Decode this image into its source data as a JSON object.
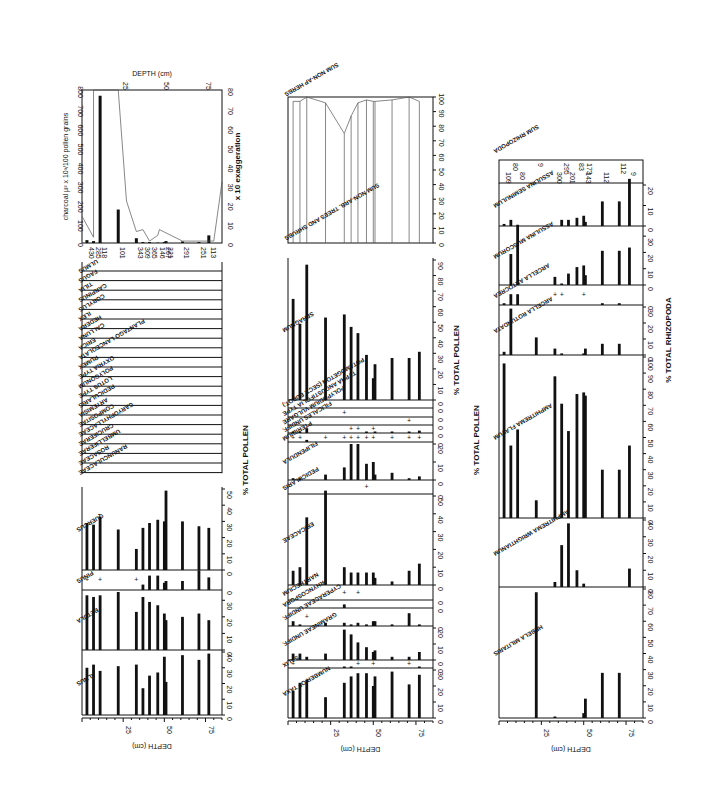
{
  "chart_data": [
    {
      "type": "bar",
      "title": "Pollen diagram panel 1 (trees, shrubs, herbs, charcoal)",
      "orientation": "rotated 90deg; depth runs left-to-right along bottom",
      "xlabel": "DEPTH (cm)",
      "ylabel": "% TOTAL POLLEN",
      "depth_ticks": [
        25,
        50,
        75
      ],
      "depths": [
        3,
        7,
        11,
        22,
        33,
        37,
        41,
        46,
        50,
        51,
        61,
        71,
        77
      ],
      "series": [
        {
          "name": "ALNUS",
          "xlim": [
            0,
            40
          ],
          "values": [
            30,
            32,
            28,
            31,
            32,
            17,
            25,
            27,
            37,
            21,
            38,
            35,
            39
          ]
        },
        {
          "name": "BETULA",
          "xlim": [
            0,
            35
          ],
          "values": [
            33,
            32,
            33,
            35,
            23,
            32,
            29,
            27,
            22,
            18,
            20,
            22,
            18
          ]
        },
        {
          "name": "PINUS",
          "xlim": [
            0,
            10
          ],
          "values": [
            0.5,
            0,
            0.5,
            0,
            0.5,
            3,
            8,
            8,
            4,
            5,
            5,
            11,
            7
          ]
        },
        {
          "name": "QUERCUS",
          "xlim": [
            0,
            50
          ],
          "values": [
            29,
            28,
            33,
            25,
            13,
            26,
            29,
            31,
            30,
            49,
            30,
            27,
            26
          ]
        }
      ],
      "minor_taxa": [
        "ULMUS",
        "FAGUS",
        "TILIA",
        "CARPINUS",
        "CORYLUS",
        "ILEX",
        "HEDERA",
        "CALLUNA",
        "ERICA",
        "PLANTAGO LANCEOLATA",
        "RUMEX",
        "OXYRIA TYPE",
        "POLYGONUM",
        "LOTUS TYPE",
        "PEDICULARIS",
        "ARTEMISIA",
        "COMPOSITAE",
        "CARYOPHYLLACEAE",
        "CRUCIFERAE",
        "UMBELLIFERAE",
        "ROSACEAE",
        "RANUNCULACEAE"
      ],
      "charcoal": {
        "ylabel": "charcoal µ² x 10³/100 pollen grains",
        "y2label": "x 10 exaggeration",
        "ylim": [
          0,
          800
        ],
        "y2lim": [
          0,
          80
        ],
        "ticks": [
          0,
          100,
          200,
          300,
          400,
          500,
          600,
          700,
          800
        ],
        "ticks2": [
          0,
          10,
          20,
          30,
          40,
          50,
          60,
          70,
          80
        ],
        "values": [
          15,
          10,
          770,
          175,
          25,
          5,
          5,
          2,
          5,
          10,
          8,
          5,
          40
        ],
        "pollen_sums": [
          "430",
          "285",
          "118",
          "101",
          "343",
          "309",
          "365",
          "146",
          "267",
          "221",
          "291",
          "251",
          "113"
        ]
      }
    },
    {
      "type": "bar",
      "title": "Pollen diagram panel 2 (heath, mire, spores)",
      "xlabel": "DEPTH (cm)",
      "ylabel": "% TOTAL POLLEN",
      "depth_ticks": [
        25,
        50,
        75
      ],
      "depths": [
        3,
        7,
        11,
        22,
        33,
        37,
        41,
        46,
        50,
        51,
        61,
        71,
        77
      ],
      "series": [
        {
          "name": "NUMBER OF TAXA",
          "xlim": [
            0,
            30
          ],
          "values": [
            17,
            22,
            24,
            13,
            22,
            26,
            28,
            28,
            20,
            26,
            29,
            21,
            27
          ]
        },
        {
          "name": "SALIX",
          "xlim": [
            0,
            5
          ],
          "values": [
            0.3,
            0,
            0,
            0,
            1,
            1,
            0.3,
            0,
            0.3,
            0,
            0,
            0.3,
            1
          ]
        },
        {
          "name": "GRAMINEAE UNDIFF.",
          "xlim": [
            0,
            20
          ],
          "values": [
            4,
            4,
            2,
            4,
            19,
            16,
            11,
            8,
            5,
            6,
            2,
            2,
            5
          ]
        },
        {
          "name": "CYPERACEAE UNDIFF.",
          "xlim": [
            0,
            10
          ],
          "values": [
            3,
            1,
            0.3,
            2,
            2,
            1,
            2,
            1,
            3,
            3,
            1,
            8,
            1
          ]
        },
        {
          "name": "RHYNCOSPORA",
          "xlim": [
            0,
            10
          ],
          "values": [
            0,
            0,
            0,
            0,
            6,
            0,
            0,
            0,
            0,
            0,
            0,
            0,
            0
          ]
        },
        {
          "name": "NARTHECIUM",
          "xlim": [
            0,
            10
          ],
          "values": [
            0,
            0,
            0,
            0,
            0.3,
            0,
            0.3,
            0,
            0,
            0,
            0,
            0,
            0
          ]
        },
        {
          "name": "ERICACEAE",
          "xlim": [
            0,
            50
          ],
          "values": [
            8,
            10,
            38,
            53,
            10,
            7,
            7,
            7,
            7,
            4,
            2,
            8,
            12
          ]
        },
        {
          "name": "PEDICULARIS",
          "xlim": [
            0,
            5
          ],
          "values": [
            0,
            0,
            0,
            0,
            0,
            0,
            0,
            0.3,
            0,
            0,
            0,
            0,
            0
          ]
        },
        {
          "name": "FILIPENDULA",
          "xlim": [
            0,
            20
          ],
          "values": [
            1,
            1,
            0,
            3,
            7,
            20,
            20,
            9,
            10,
            3,
            4,
            1,
            2
          ]
        },
        {
          "name": "PTERIDIUM",
          "xlim": [
            0,
            5
          ],
          "values": [
            0.3,
            0.3,
            1.5,
            0.5,
            0.3,
            0.3,
            0.3,
            0.5,
            0.5,
            0,
            0.3,
            0.3,
            0.3
          ]
        },
        {
          "name": "FILICALES UNDIFF.",
          "xlim": [
            0,
            10
          ],
          "values": [
            2,
            2,
            8,
            0,
            0,
            0.3,
            0.3,
            2,
            0.3,
            1,
            2,
            2,
            4
          ]
        },
        {
          "name": "POLYPODIUM VULGARE",
          "xlim": [
            0,
            10
          ],
          "values": [
            0,
            0,
            0,
            0,
            0,
            0,
            0,
            0,
            0,
            0,
            0,
            0.3,
            0
          ]
        },
        {
          "name": "TYPHA ANGUSTIFOLIA TYPE",
          "xlim": [
            0,
            10
          ],
          "values": [
            0,
            0,
            0,
            0,
            0.3,
            0,
            0,
            0,
            0,
            0,
            0,
            0,
            0
          ]
        },
        {
          "name": "POTAMOGETON (SECT. EUPOT.)",
          "xlim": [
            0,
            10
          ],
          "values": [
            0,
            0,
            0,
            0,
            0,
            0,
            0,
            0,
            0,
            0,
            0,
            0,
            0
          ]
        },
        {
          "name": "SPHAGNUM",
          "xlim": [
            0,
            90
          ],
          "values": [
            65,
            49,
            87,
            53,
            55,
            47,
            43,
            29,
            14,
            23,
            27,
            27,
            31
          ]
        }
      ],
      "summary_curve": {
        "name": "SUM NON-AP HERBS / TREES AND SHRUBS",
        "xlim": [
          0,
          100
        ],
        "ticks": [
          0,
          10,
          20,
          30,
          40,
          50,
          60,
          70,
          80,
          90,
          100
        ],
        "values": [
          97,
          97,
          100,
          96,
          75,
          87,
          96,
          98,
          97,
          97,
          98,
          100,
          97
        ]
      }
    },
    {
      "type": "bar",
      "title": "Rhizopod diagram panel 3",
      "xlabel": "DEPTH (cm)",
      "ylabel": "% TOTAL RHIZOPODA",
      "depth_ticks": [
        25,
        50,
        75
      ],
      "depths": [
        3,
        7,
        11,
        22,
        33,
        37,
        41,
        46,
        50,
        51,
        61,
        71,
        77
      ],
      "series": [
        {
          "name": "HEBELA MILITARIS",
          "xlim": [
            0,
            80
          ],
          "values": [
            0,
            0,
            0,
            78,
            0.5,
            0,
            0,
            0,
            3,
            12,
            28,
            28,
            0
          ]
        },
        {
          "name": "AMPHITREMA WRIGHTIANUM",
          "xlim": [
            0,
            40
          ],
          "values": [
            0,
            0,
            0,
            0,
            3,
            25,
            38,
            10,
            2,
            0,
            0,
            0,
            11
          ]
        },
        {
          "name": "AMPHITREMA FLAVUM",
          "xlim": [
            0,
            100
          ],
          "values": [
            96,
            45,
            55,
            11,
            88,
            71,
            54,
            77,
            78,
            76,
            30,
            30,
            45
          ]
        },
        {
          "name": "ARCELLA ROTUNDATA",
          "xlim": [
            0,
            30
          ],
          "values": [
            2,
            29,
            0,
            11,
            4,
            1,
            0,
            0,
            1,
            4,
            7,
            7,
            0
          ]
        },
        {
          "name": "ARCELLA ARTOCREA",
          "xlim": [
            0,
            10
          ],
          "values": [
            1,
            6,
            6,
            0,
            0.3,
            0.3,
            0,
            0,
            0.3,
            0,
            1,
            1,
            0
          ]
        },
        {
          "name": "ASSULINA MUSCORUM",
          "xlim": [
            0,
            35
          ],
          "values": [
            0,
            19,
            37,
            0,
            5,
            0.3,
            7,
            11,
            12,
            6,
            21,
            21,
            23
          ]
        },
        {
          "name": "ASSULINA SEMINULUM",
          "xlim": [
            0,
            20
          ],
          "values": [
            1,
            3,
            0,
            0,
            0,
            3,
            3,
            4,
            5,
            2,
            12,
            12,
            23
          ]
        }
      ],
      "rhizopod_sums": [
        "109",
        "80",
        "80",
        "9",
        "300",
        "295",
        "201",
        "83",
        "143",
        "173",
        "112",
        "112",
        "9"
      ],
      "sum_label": "SUM RHIZOPODA"
    }
  ],
  "labels": {
    "depth_axis": "DEPTH (cm)",
    "depth_top": "DEPTH (cm)",
    "total_pollen": "% TOTAL POLLEN",
    "total_rhizopoda": "% TOTAL RHIZOPODA",
    "charcoal_axis": "charcoal µ² x 10³/100 pollen grains",
    "exaggeration": "x 10 exaggeration",
    "sum_herbs": "SUM NON-AP HERBS",
    "trees_shrubs": "SUM NON-ARB. TREES AND SHRUBS",
    "sum_rhizopoda": "SUM RHIZOPODA"
  }
}
